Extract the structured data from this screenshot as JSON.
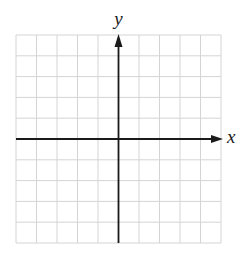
{
  "diagram": {
    "type": "coordinate-plane",
    "grid": {
      "columns": 10,
      "rows": 10,
      "left": 16,
      "top": 35,
      "right": 221,
      "bottom": 243,
      "line_color": "#d4d4d4"
    },
    "axes": {
      "color": "#1a1a1a",
      "x_axis": {
        "label": "x",
        "origin_column": 5,
        "arrow": "right"
      },
      "y_axis": {
        "label": "y",
        "origin_row": 5,
        "arrow": "up"
      }
    }
  }
}
